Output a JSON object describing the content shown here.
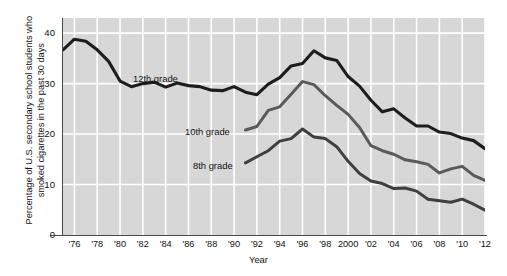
{
  "chart_data": {
    "type": "line",
    "title": "",
    "xlabel": "Year",
    "ylabel": "Percentage of U.S. secondary school students who smoked cigarettes in the past 30 days",
    "xlim": [
      1975,
      2012
    ],
    "ylim": [
      0,
      43
    ],
    "grid": true,
    "legend_position": "inline-annotations",
    "background_color": "#d7d7d7",
    "gridline_color": "#ffffff",
    "y_ticks": [
      "0",
      "10",
      "20",
      "30",
      "40"
    ],
    "y_tick_values": [
      0,
      10,
      20,
      30,
      40
    ],
    "x_ticks": [
      "'76",
      "'78",
      "'80",
      "'82",
      "'84",
      "'86",
      "'88",
      "'90",
      "'92",
      "'94",
      "'96",
      "'98",
      "2000",
      "'02",
      "'04",
      "'06",
      "'08",
      "'10",
      "'12"
    ],
    "x_tick_values": [
      1976,
      1978,
      1980,
      1982,
      1984,
      1986,
      1988,
      1990,
      1992,
      1994,
      1996,
      1998,
      2000,
      2002,
      2004,
      2006,
      2008,
      2010,
      2012
    ],
    "series": [
      {
        "name": "12th grade",
        "color": "#1d1d1d",
        "width": 3.1,
        "x": [
          1975,
          1976,
          1977,
          1978,
          1979,
          1980,
          1981,
          1982,
          1983,
          1984,
          1985,
          1986,
          1987,
          1988,
          1989,
          1990,
          1991,
          1992,
          1993,
          1994,
          1995,
          1996,
          1997,
          1998,
          1999,
          2000,
          2001,
          2002,
          2003,
          2004,
          2005,
          2006,
          2007,
          2008,
          2009,
          2010,
          2011,
          2012
        ],
        "values": [
          36.7,
          38.8,
          38.4,
          36.7,
          34.4,
          30.5,
          29.4,
          30.0,
          30.3,
          29.3,
          30.1,
          29.6,
          29.4,
          28.7,
          28.6,
          29.4,
          28.3,
          27.8,
          29.9,
          31.2,
          33.5,
          34.0,
          36.5,
          35.1,
          34.6,
          31.4,
          29.5,
          26.7,
          24.4,
          25.0,
          23.2,
          21.6,
          21.6,
          20.4,
          20.1,
          19.2,
          18.7,
          17.1
        ]
      },
      {
        "name": "10th grade",
        "color": "#5a5a5a",
        "width": 3.0,
        "x": [
          1991,
          1992,
          1993,
          1994,
          1995,
          1996,
          1997,
          1998,
          1999,
          2000,
          2001,
          2002,
          2003,
          2004,
          2005,
          2006,
          2007,
          2008,
          2009,
          2010,
          2011,
          2012
        ],
        "values": [
          20.8,
          21.5,
          24.7,
          25.4,
          27.9,
          30.4,
          29.8,
          27.6,
          25.7,
          23.9,
          21.3,
          17.7,
          16.7,
          16.0,
          14.9,
          14.5,
          14.0,
          12.3,
          13.1,
          13.6,
          11.8,
          10.8
        ]
      },
      {
        "name": "8th grade",
        "color": "#3f3f3f",
        "width": 3.0,
        "x": [
          1991,
          1992,
          1993,
          1994,
          1995,
          1996,
          1997,
          1998,
          1999,
          2000,
          2001,
          2002,
          2003,
          2004,
          2005,
          2006,
          2007,
          2008,
          2009,
          2010,
          2011,
          2012
        ],
        "values": [
          14.3,
          15.5,
          16.7,
          18.6,
          19.1,
          21.0,
          19.4,
          19.1,
          17.5,
          14.6,
          12.2,
          10.7,
          10.2,
          9.2,
          9.3,
          8.7,
          7.1,
          6.8,
          6.5,
          7.1,
          6.1,
          4.9
        ]
      }
    ],
    "annotations": [
      {
        "text": "12th grade",
        "series": "12th grade"
      },
      {
        "text": "10th grade",
        "series": "10th grade"
      },
      {
        "text": "8th grade",
        "series": "8th grade"
      }
    ]
  },
  "axes": {
    "y_title": "Percentage of U.S. secondary school students who smoked cigarettes in the past 30 days",
    "x_title": "Year"
  },
  "labels": {
    "grade12": "12th grade",
    "grade10": "10th grade",
    "grade8": "8th grade"
  }
}
